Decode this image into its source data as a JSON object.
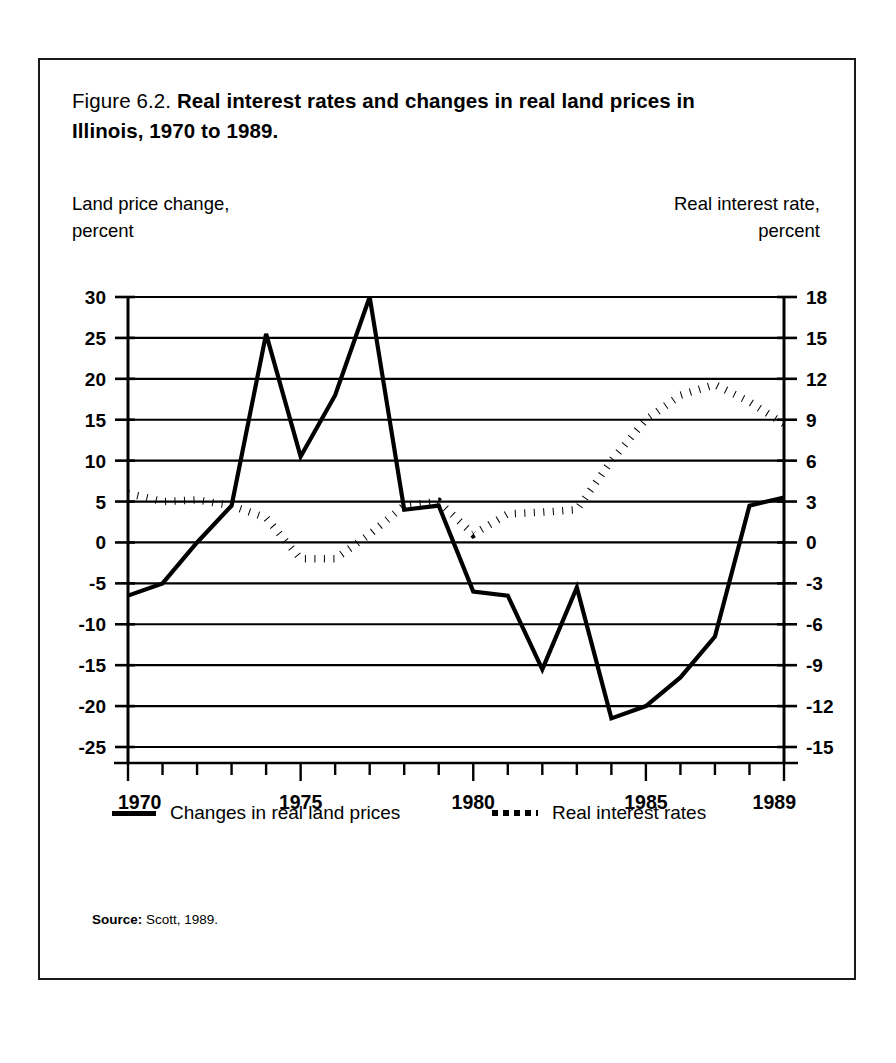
{
  "figure": {
    "number_label": "Figure 6.2.",
    "title": "Real interest rates and changes in real land prices in Illinois, 1970 to 1989.",
    "left_axis_caption_line1": "Land price change,",
    "left_axis_caption_line2": "percent",
    "right_axis_caption_line1": "Real interest rate,",
    "right_axis_caption_line2": "percent",
    "source_label": "Source:",
    "source_text": "Scott, 1989."
  },
  "legend": {
    "items": [
      {
        "label": "Changes in real land prices",
        "style": "solid",
        "swatch": "solid-line-swatch"
      },
      {
        "label": "Real interest rates",
        "style": "dotted",
        "swatch": "dotted-line-swatch"
      }
    ]
  },
  "chart_data": {
    "type": "line",
    "title": "Real interest rates and changes in real land prices in Illinois, 1970 to 1989.",
    "xlabel": "",
    "ylabel": "Land price change, percent",
    "y2label": "Real interest rate, percent",
    "grid": true,
    "legend_position": "bottom",
    "x": [
      1970,
      1971,
      1972,
      1973,
      1974,
      1975,
      1976,
      1977,
      1978,
      1979,
      1980,
      1981,
      1982,
      1983,
      1984,
      1985,
      1986,
      1987,
      1988,
      1989
    ],
    "xlim": [
      1970,
      1989
    ],
    "xtick_labels": [
      "1970",
      "1975",
      "1980",
      "1985",
      "1989"
    ],
    "xtick_values": [
      1970,
      1975,
      1980,
      1985,
      1989
    ],
    "xtick_minor_every": 1,
    "ylim": [
      -25,
      30
    ],
    "ytick_labels": [
      "30",
      "25",
      "20",
      "15",
      "10",
      "5",
      "0",
      "-5",
      "-10",
      "-15",
      "-20",
      "-25"
    ],
    "ytick_values": [
      30,
      25,
      20,
      15,
      10,
      5,
      0,
      -5,
      -10,
      -15,
      -20,
      -25
    ],
    "y2lim": [
      -15,
      18
    ],
    "y2tick_labels": [
      "18",
      "15",
      "12",
      "9",
      "6",
      "3",
      "0",
      "-3",
      "-6",
      "-9",
      "-12",
      "-15"
    ],
    "y2tick_values": [
      18,
      15,
      12,
      9,
      6,
      3,
      0,
      -3,
      -6,
      -9,
      -12,
      -15
    ],
    "series": [
      {
        "name": "Changes in real land prices",
        "axis": "left",
        "style": "solid",
        "unit": "percent",
        "values": [
          -6.5,
          -5.0,
          0.0,
          4.5,
          25.5,
          10.5,
          18.0,
          30.0,
          4.0,
          4.5,
          -6.0,
          -6.5,
          -15.5,
          -5.5,
          -21.5,
          -20.0,
          -16.5,
          -11.5,
          4.5,
          5.5
        ]
      },
      {
        "name": "Real interest rates",
        "axis": "right",
        "style": "dotted",
        "unit": "percent",
        "values": [
          3.3,
          2.6,
          2.8,
          2.3,
          1.3,
          -1.2,
          -1.2,
          0.5,
          2.5,
          2.6,
          0.6,
          1.9,
          2.0,
          2.2,
          6.0,
          8.9,
          10.7,
          11.6,
          10.3,
          8.7
        ],
        "values_left_axis_equivalent": [
          6.0,
          5.0,
          5.2,
          4.5,
          3.0,
          -2.0,
          -2.0,
          1.0,
          4.5,
          5.0,
          1.0,
          3.5,
          3.7,
          4.0,
          10.0,
          15.0,
          18.0,
          19.3,
          17.2,
          14.5
        ]
      }
    ]
  }
}
